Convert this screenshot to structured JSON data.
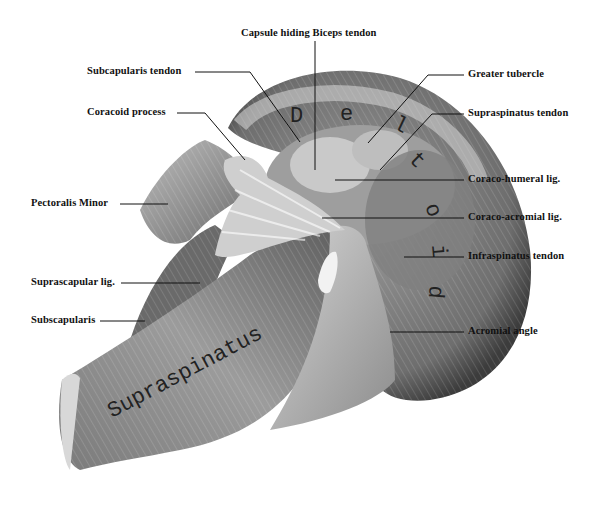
{
  "figure": {
    "colors": {
      "background": "#ffffff",
      "ink": "#111111",
      "muscle_dark": "#4a4a4a",
      "muscle_mid": "#8a8a8a",
      "muscle_light": "#c8c8c8"
    },
    "in_figure_labels": {
      "deltoid": "Deltoid",
      "supraspinatus": "Supraspinatus"
    },
    "labels_top": {
      "capsule": "Capsule hiding Biceps tendon"
    },
    "labels_left": {
      "subscapularis_tendon": "Subcapularis tendon",
      "coracoid_process": "Coracoid process",
      "pectoralis_minor": "Pectoralis Minor",
      "suprascapular_lig": "Suprascapular lig.",
      "subscapularis": "Subscapularis"
    },
    "labels_right": {
      "greater_tubercle": "Greater tubercle",
      "supraspinatus_tendon": "Supraspinatus tendon",
      "coraco_humeral_lig": "Coraco-humeral lig.",
      "coraco_acromial_lig": "Coraco-acromial lig.",
      "infraspinatus_tendon": "Infraspinatus tendon",
      "acromial_angle": "Acromial angle"
    }
  }
}
